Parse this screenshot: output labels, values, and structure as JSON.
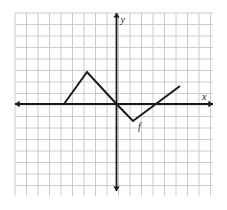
{
  "figure": {
    "background_color": "#ffffff",
    "grid": {
      "line_color": "#c6c6c6",
      "cell_size_px": 11.5,
      "left_px": 15,
      "top_px": 13,
      "right_px": 213,
      "bottom_px": 196,
      "columns": 17,
      "rows": 16,
      "visible": true
    },
    "axes": {
      "color": "#1a1a1a",
      "origin_px": {
        "x": 116.5,
        "y": 104
      },
      "x_axis": {
        "start_px": 15,
        "end_px": 213,
        "y_px": 104,
        "arrow_start": true,
        "arrow_end": true
      },
      "y_axis": {
        "top_px": 13,
        "bottom_px": 191,
        "x_px": 116.5,
        "arrow_start": true,
        "arrow_end": true
      }
    },
    "labels": {
      "x_axis_label": "x",
      "y_axis_label": "y",
      "function_label": "f"
    }
  },
  "chart_data": {
    "type": "line",
    "title": "",
    "xlabel": "x",
    "ylabel": "y",
    "series": [
      {
        "name": "f",
        "points": [
          {
            "x": -4.5,
            "y": 0
          },
          {
            "x": -2.5,
            "y": 2.75
          },
          {
            "x": 0,
            "y": 0
          },
          {
            "x": 1.5,
            "y": -1.5
          },
          {
            "x": 5.5,
            "y": 1.5
          }
        ],
        "pixel_points": [
          {
            "x": 64,
            "y": 104
          },
          {
            "x": 87,
            "y": 72
          },
          {
            "x": 116.5,
            "y": 104
          },
          {
            "x": 133,
            "y": 121
          },
          {
            "x": 180,
            "y": 86
          }
        ],
        "color": "#1a1a1a",
        "line_width": 2
      }
    ],
    "xlim": [
      -8.8,
      8.4
    ],
    "ylim": [
      -8,
      7.9
    ],
    "grid": true,
    "legend": "none",
    "annotations": [
      {
        "text": "f",
        "x": 1.9,
        "y": -1.9,
        "style": "italic"
      },
      {
        "text": "x",
        "x": 7.8,
        "y": 0.65,
        "style": "italic"
      },
      {
        "text": "y",
        "x": 0.55,
        "y": 7.3,
        "style": "italic"
      }
    ]
  }
}
